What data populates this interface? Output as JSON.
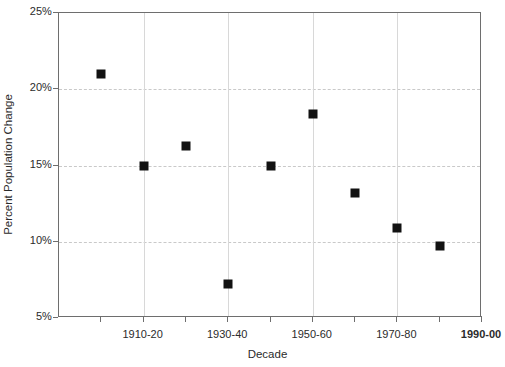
{
  "chart_data": {
    "type": "scatter",
    "title": "",
    "xlabel": "Decade",
    "ylabel": "Percent Population Change",
    "grid": true,
    "legend": "none",
    "ylim": [
      5,
      25
    ],
    "ytick_labels": [
      "25%",
      "20%",
      "15%",
      "10%",
      "5%"
    ],
    "ytick_values": [
      25,
      20,
      15,
      10,
      5
    ],
    "xtick_labels": [
      "1910-20",
      "1930-40",
      "1950-60",
      "1970-80",
      "1990-00"
    ],
    "xtick_label_bold": [
      false,
      false,
      false,
      false,
      true
    ],
    "categories": [
      "1900-10",
      "1910-20",
      "1920-30",
      "1930-40",
      "1940-50",
      "1950-60",
      "1960-70",
      "1970-80",
      "1980-90"
    ],
    "values": [
      21.0,
      15.0,
      16.3,
      7.2,
      15.0,
      18.4,
      13.2,
      10.9,
      9.7
    ],
    "marker": "square",
    "marker_color": "#121212"
  },
  "axes": {
    "y_title": "Percent Population Change",
    "x_title": "Decade",
    "y_ticks": [
      {
        "label": "25%",
        "value": 25
      },
      {
        "label": "20%",
        "value": 20
      },
      {
        "label": "15%",
        "value": 15
      },
      {
        "label": "10%",
        "value": 10
      },
      {
        "label": "5%",
        "value": 5
      }
    ],
    "x_ticks": [
      {
        "label": "",
        "index": 0
      },
      {
        "label": "1910-20",
        "index": 1
      },
      {
        "label": "",
        "index": 2
      },
      {
        "label": "1930-40",
        "index": 3
      },
      {
        "label": "",
        "index": 4
      },
      {
        "label": "1950-60",
        "index": 5
      },
      {
        "label": "",
        "index": 6
      },
      {
        "label": "1970-80",
        "index": 7
      },
      {
        "label": "",
        "index": 8
      },
      {
        "label": "1990-00",
        "index": 9
      }
    ]
  },
  "style": {
    "background": "#ffffff",
    "frame_color": "#6e6e6e",
    "grid_color": "#c9c9c9",
    "text_color": "#2b2b2b"
  }
}
